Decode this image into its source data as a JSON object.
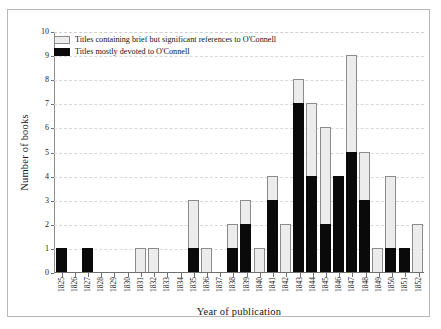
{
  "chart_data": {
    "type": "bar",
    "subtype": "stacked-vertical",
    "title": "",
    "xlabel": "Year of publication",
    "ylabel": "Number of books",
    "ylim": [
      0,
      10
    ],
    "ytick_step": 1,
    "yticks": [
      "10",
      "9",
      "8",
      "7",
      "6",
      "5",
      "4",
      "3",
      "2",
      "1",
      "0"
    ],
    "grid": "horizontal-dashed",
    "legend_position": "top-left-inside",
    "categories": [
      "1825",
      "1826",
      "1827",
      "1828",
      "1829",
      "1830",
      "1831",
      "1832",
      "1833",
      "1834",
      "1835",
      "1836",
      "1837",
      "1838",
      "1839",
      "1840",
      "1841",
      "1842",
      "1843",
      "1844",
      "1845",
      "1846",
      "1847",
      "1848",
      "1849",
      "1850",
      "1851",
      "1852"
    ],
    "series": [
      {
        "name": "Titles mostly devoted to O'Connell",
        "color": "#0a0a0a",
        "values": [
          1,
          0,
          1,
          0,
          0,
          0,
          0,
          0,
          0,
          0,
          1,
          0,
          0,
          1,
          2,
          0,
          3,
          0,
          7,
          4,
          2,
          4,
          5,
          3,
          0,
          1,
          1,
          0
        ]
      },
      {
        "name": "Titles containing brief but significant references to O'Connell",
        "color": "#ececec",
        "values": [
          0,
          0,
          0,
          0,
          0,
          0,
          1,
          1,
          0,
          0,
          2,
          1,
          0,
          1,
          1,
          1,
          1,
          2,
          1,
          3,
          4,
          0,
          4,
          2,
          1,
          3,
          0,
          2
        ]
      }
    ],
    "totals": [
      1,
      0,
      1,
      0,
      0,
      0,
      1,
      1,
      0,
      0,
      3,
      1,
      0,
      2,
      3,
      1,
      4,
      2,
      8,
      7,
      6,
      4,
      9,
      5,
      1,
      4,
      1,
      2
    ]
  },
  "legend": {
    "items": [
      {
        "label": "Titles containing brief but significant references to O'Connell",
        "swatch": "grey"
      },
      {
        "label": "Titles mostly devoted to O'Connell",
        "swatch": "black"
      }
    ]
  },
  "axes": {
    "x_title": "Year of publication",
    "y_title": "Number of books"
  }
}
